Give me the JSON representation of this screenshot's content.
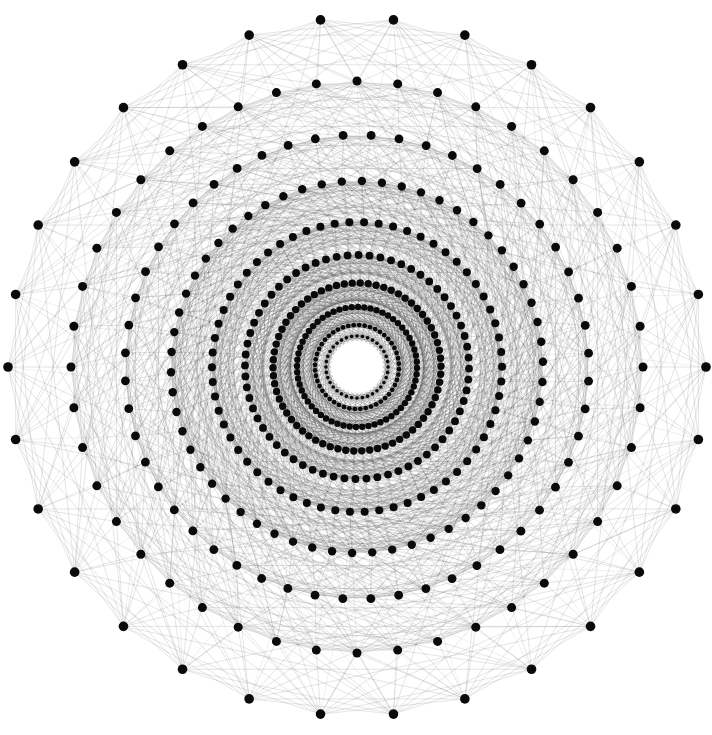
{
  "figure": {
    "kind": "graph-visualization",
    "title": "",
    "background_color": "#ffffff",
    "width": 712,
    "height": 735
  },
  "chart_data": {
    "type": "scatter",
    "title": "",
    "subtitle": "",
    "xlabel": "",
    "ylabel": "",
    "grid": false,
    "legend": null,
    "layout": "concentric-circular",
    "center": {
      "x": 357,
      "y": 367
    },
    "outer_radius": 349,
    "node_color": "#0a0a0a",
    "node_radius_px": 4.6,
    "edge_color": "#3a3a3a",
    "edge_width_px": 0.45,
    "edge_opacity": 0.34,
    "center_hole_radius": 26,
    "rings": [
      {
        "name": "ring-0",
        "radius": 349,
        "count": 30,
        "angle_offset_deg": 6.0,
        "node_radius_px": 4.8
      },
      {
        "name": "ring-1",
        "radius": 286,
        "count": 44,
        "angle_offset_deg": 0.0,
        "node_radius_px": 4.5
      },
      {
        "name": "ring-2",
        "radius": 232,
        "count": 52,
        "angle_offset_deg": 3.5,
        "node_radius_px": 4.4
      },
      {
        "name": "ring-3",
        "radius": 186,
        "count": 58,
        "angle_offset_deg": 1.5,
        "node_radius_px": 4.2
      },
      {
        "name": "ring-4",
        "radius": 145,
        "count": 62,
        "angle_offset_deg": 2.8,
        "node_radius_px": 4.0
      },
      {
        "name": "ring-5",
        "radius": 112,
        "count": 64,
        "angle_offset_deg": 0.8,
        "node_radius_px": 3.9
      },
      {
        "name": "ring-6",
        "radius": 84,
        "count": 66,
        "angle_offset_deg": 2.2,
        "node_radius_px": 3.7
      },
      {
        "name": "ring-7",
        "radius": 60,
        "count": 60,
        "angle_offset_deg": 1.0,
        "node_radius_px": 3.2
      },
      {
        "name": "ring-8",
        "radius": 42,
        "count": 48,
        "angle_offset_deg": 3.0,
        "node_radius_px": 2.4
      },
      {
        "name": "ring-9",
        "radius": 31,
        "count": 36,
        "angle_offset_deg": 0.0,
        "node_radius_px": 1.8
      }
    ],
    "edge_rules": [
      {
        "from_ring": 0,
        "to_ring": 0,
        "chord_steps": [
          2,
          3,
          5,
          7,
          11
        ],
        "opacity": 0.3
      },
      {
        "from_ring": 0,
        "to_ring": 1,
        "chord_steps": [
          0,
          1,
          2,
          3
        ],
        "opacity": 0.3
      },
      {
        "from_ring": 1,
        "to_ring": 1,
        "chord_steps": [
          2,
          3,
          5,
          8,
          13
        ],
        "opacity": 0.3
      },
      {
        "from_ring": 1,
        "to_ring": 2,
        "chord_steps": [
          0,
          1,
          2,
          4
        ],
        "opacity": 0.3
      },
      {
        "from_ring": 2,
        "to_ring": 2,
        "chord_steps": [
          2,
          3,
          5,
          9,
          14
        ],
        "opacity": 0.32
      },
      {
        "from_ring": 2,
        "to_ring": 3,
        "chord_steps": [
          0,
          1,
          3,
          5
        ],
        "opacity": 0.32
      },
      {
        "from_ring": 3,
        "to_ring": 3,
        "chord_steps": [
          2,
          4,
          6,
          10,
          15
        ],
        "opacity": 0.34
      },
      {
        "from_ring": 3,
        "to_ring": 4,
        "chord_steps": [
          0,
          1,
          3,
          6
        ],
        "opacity": 0.34
      },
      {
        "from_ring": 4,
        "to_ring": 4,
        "chord_steps": [
          2,
          4,
          7,
          11,
          17
        ],
        "opacity": 0.36
      },
      {
        "from_ring": 4,
        "to_ring": 5,
        "chord_steps": [
          0,
          2,
          4,
          7
        ],
        "opacity": 0.36
      },
      {
        "from_ring": 5,
        "to_ring": 5,
        "chord_steps": [
          2,
          4,
          8,
          12,
          19
        ],
        "opacity": 0.38
      },
      {
        "from_ring": 5,
        "to_ring": 6,
        "chord_steps": [
          0,
          2,
          5,
          8
        ],
        "opacity": 0.38
      },
      {
        "from_ring": 6,
        "to_ring": 6,
        "chord_steps": [
          2,
          5,
          9,
          14,
          21
        ],
        "opacity": 0.4
      },
      {
        "from_ring": 6,
        "to_ring": 7,
        "chord_steps": [
          0,
          2,
          5,
          9
        ],
        "opacity": 0.4
      },
      {
        "from_ring": 7,
        "to_ring": 7,
        "chord_steps": [
          2,
          5,
          9,
          15
        ],
        "opacity": 0.42
      },
      {
        "from_ring": 7,
        "to_ring": 8,
        "chord_steps": [
          0,
          2,
          6
        ],
        "opacity": 0.42
      },
      {
        "from_ring": 8,
        "to_ring": 8,
        "chord_steps": [
          2,
          5,
          11
        ],
        "opacity": 0.44
      },
      {
        "from_ring": 8,
        "to_ring": 9,
        "chord_steps": [
          0,
          3
        ],
        "opacity": 0.44
      },
      {
        "from_ring": 9,
        "to_ring": 9,
        "chord_steps": [
          2,
          5,
          9
        ],
        "opacity": 0.46
      },
      {
        "from_ring": 2,
        "to_ring": 5,
        "chord_steps": [
          0,
          6
        ],
        "opacity": 0.22
      },
      {
        "from_ring": 1,
        "to_ring": 4,
        "chord_steps": [
          0,
          8
        ],
        "opacity": 0.2
      },
      {
        "from_ring": 3,
        "to_ring": 6,
        "chord_steps": [
          0,
          7
        ],
        "opacity": 0.22
      },
      {
        "from_ring": 4,
        "to_ring": 7,
        "chord_steps": [
          0,
          6
        ],
        "opacity": 0.24
      },
      {
        "from_ring": 0,
        "to_ring": 2,
        "chord_steps": [
          0,
          4
        ],
        "opacity": 0.18
      }
    ]
  }
}
